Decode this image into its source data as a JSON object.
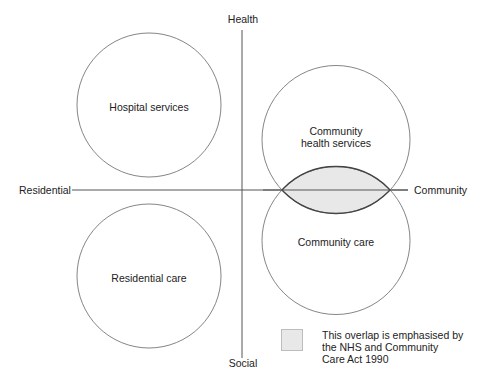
{
  "axes": {
    "top": "Health",
    "bottom": "Social",
    "left": "Residential",
    "right": "Community"
  },
  "circles": [
    {
      "label": "Hospital services"
    },
    {
      "label_lines": [
        "Community",
        "health services"
      ]
    },
    {
      "label": "Residential care"
    },
    {
      "label": "Community care"
    }
  ],
  "legend": {
    "lines": [
      "This overlap is emphasised by",
      "the NHS and Community",
      "Care Act 1990"
    ]
  },
  "colors": {
    "stroke": "#555555",
    "overlap_fill": "#e8e8e8"
  }
}
